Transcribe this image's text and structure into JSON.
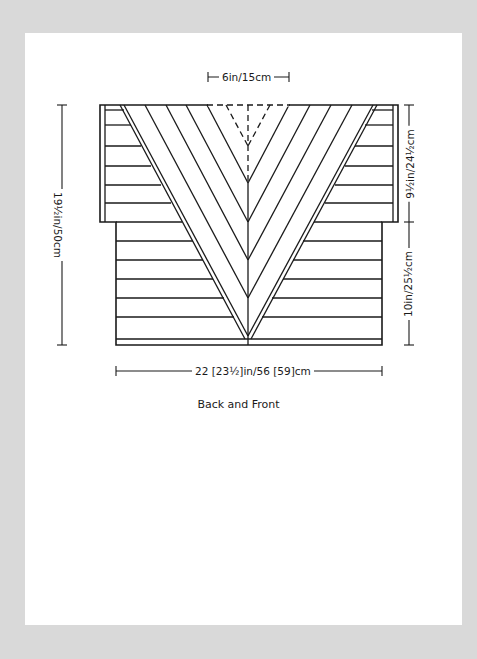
{
  "diagram": {
    "title": "Back and Front",
    "dimensions": {
      "top_width": "6in/15cm",
      "total_length": "19½in/50cm",
      "armhole_depth": "9½in/24½cm",
      "body_length": "10in/25½cm",
      "width": "22 [23½]in/56 [59]cm"
    },
    "colors": {
      "background": "#d9d9d9",
      "card": "#ffffff",
      "ink": "#1a1a1a"
    }
  }
}
